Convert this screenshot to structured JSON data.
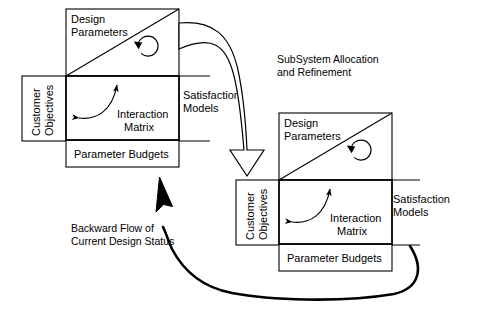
{
  "diagram": {
    "title_visible": false,
    "background_color": "#ffffff",
    "stroke_color": "#000000",
    "blocks": [
      {
        "id": "primary-system",
        "design_parameters": "Design\nParameters",
        "design_parameters_line1": "Design",
        "design_parameters_line2": "Parameters",
        "customer_objectives_line1": "Customer",
        "customer_objectives_line2": "Objectives",
        "interaction_matrix_line1": "Interaction",
        "interaction_matrix_line2": "Matrix",
        "satisfaction_models_line1": "Satisfaction",
        "satisfaction_models_line2": "Models",
        "parameter_budgets": "Parameter Budgets"
      },
      {
        "id": "subsystem",
        "design_parameters_line1": "Design",
        "design_parameters_line2": "Parameters",
        "customer_objectives_line1": "Customer",
        "customer_objectives_line2": "Objectives",
        "interaction_matrix_line1": "Interaction",
        "interaction_matrix_line2": "Matrix",
        "satisfaction_models_line1": "Satisfaction",
        "satisfaction_models_line2": "Models",
        "parameter_budgets": "Parameter Budgets"
      }
    ],
    "flows": [
      {
        "id": "forward",
        "line1": "SubSystem Allocation",
        "line2": "and Refinement",
        "style": "hollow-block-arrow",
        "direction": "down-right"
      },
      {
        "id": "backward",
        "line1": "Backward Flow of",
        "line2": "Current Design Status",
        "style": "thick-curved-arrow",
        "direction": "up-left"
      }
    ]
  }
}
